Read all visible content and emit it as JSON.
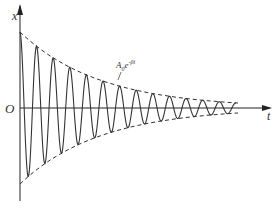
{
  "diagram": {
    "axis_x_label": "t",
    "axis_y_label": "x",
    "origin_label": "O",
    "envelope_label_base": "A",
    "envelope_label_sub": "0",
    "envelope_label_e": "e",
    "envelope_label_exp": "-βt",
    "colors": {
      "curve": "#333333",
      "axis": "#222222",
      "background": "#ffffff"
    }
  },
  "chart_data": {
    "type": "line",
    "xlabel": "t",
    "ylabel": "x",
    "annotations": [
      "A0 e^(-βt) (envelope)",
      "O (origin)"
    ],
    "series": [
      {
        "name": "x(t) = A0 e^(-βt) cos(ωt)",
        "style": "solid",
        "cycles": 13
      },
      {
        "name": "+A0 e^(-βt)",
        "style": "dashed"
      },
      {
        "name": "-A0 e^(-βt)",
        "style": "dashed"
      }
    ],
    "grid": false,
    "legend": "none"
  }
}
